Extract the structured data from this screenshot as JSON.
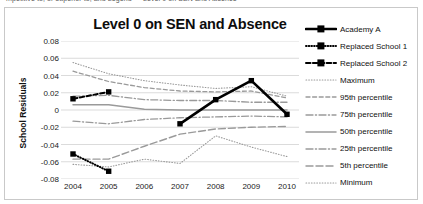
{
  "page": {
    "cut_off_header_text": "mpetitive to, or superior to, and Legend — Level 0 on SEN and Absence"
  },
  "chart_data": {
    "type": "line",
    "title": "Level 0 on SEN and Absence",
    "xlabel": "",
    "ylabel": "School Residuals",
    "categories": [
      "2004",
      "2005",
      "2006",
      "2007",
      "2008",
      "2009",
      "2010"
    ],
    "x": [
      2004,
      2005,
      2006,
      2007,
      2008,
      2009,
      2010
    ],
    "ylim": [
      -0.08,
      0.08
    ],
    "ytick_labels": [
      "0.08",
      "0.06",
      "0.04",
      "0.02",
      "0",
      "-0.02",
      "-0.04",
      "-0.06",
      "-0.08"
    ],
    "ytick_values": [
      0.08,
      0.06,
      0.04,
      0.02,
      0,
      -0.02,
      -0.04,
      -0.06,
      -0.08
    ],
    "grid": true,
    "legend_position": "right",
    "series": [
      {
        "name": "Academy A",
        "style": "solid-thick-square",
        "color": "#000000",
        "values": [
          null,
          null,
          null,
          -0.016,
          0.012,
          0.034,
          -0.005
        ]
      },
      {
        "name": "Replaced School 1",
        "style": "dotted-square",
        "color": "#000000",
        "values": [
          -0.051,
          -0.071,
          null,
          null,
          null,
          null,
          null
        ]
      },
      {
        "name": "Replaced School 2",
        "style": "dashed-square",
        "color": "#000000",
        "values": [
          0.013,
          0.021,
          null,
          null,
          null,
          null,
          null
        ]
      },
      {
        "name": "Maximum",
        "style": "fine-dotted",
        "color": "#9a9a9a",
        "values": [
          0.055,
          0.042,
          0.034,
          0.029,
          0.025,
          0.027,
          0.016
        ]
      },
      {
        "name": "95th percentile",
        "style": "dashed",
        "color": "#9a9a9a",
        "values": [
          0.045,
          0.033,
          0.026,
          0.022,
          0.021,
          0.022,
          0.014
        ]
      },
      {
        "name": "75th percentile",
        "style": "dash-dot",
        "color": "#9a9a9a",
        "values": [
          0.016,
          0.017,
          0.012,
          0.011,
          0.011,
          0.009,
          0.009
        ]
      },
      {
        "name": "50th percentile",
        "style": "solid",
        "color": "#9a9a9a",
        "values": [
          0.006,
          0.006,
          0.001,
          0.0,
          0.0,
          0.0,
          0.0
        ]
      },
      {
        "name": "25th percentile",
        "style": "dash-dot",
        "color": "#9a9a9a",
        "values": [
          -0.013,
          -0.016,
          -0.011,
          -0.009,
          -0.008,
          -0.007,
          -0.008
        ]
      },
      {
        "name": "5th percentile",
        "style": "long-dashed",
        "color": "#9a9a9a",
        "values": [
          -0.057,
          -0.057,
          -0.042,
          -0.028,
          -0.022,
          -0.02,
          -0.019
        ]
      },
      {
        "name": "Minimum",
        "style": "fine-dotted",
        "color": "#9a9a9a",
        "values": [
          -0.063,
          -0.066,
          -0.057,
          -0.062,
          -0.03,
          -0.043,
          -0.054
        ]
      }
    ]
  },
  "legend": {
    "items": [
      {
        "label": "Academy A"
      },
      {
        "label": "Replaced School 1"
      },
      {
        "label": "Replaced School 2"
      },
      {
        "label": "Maximum"
      },
      {
        "label": "95th percentile"
      },
      {
        "label": "75th percentile"
      },
      {
        "label": "50th percentile"
      },
      {
        "label": "25th  percentile"
      },
      {
        "label": "5th percentile"
      },
      {
        "label": "Minimum"
      }
    ]
  }
}
